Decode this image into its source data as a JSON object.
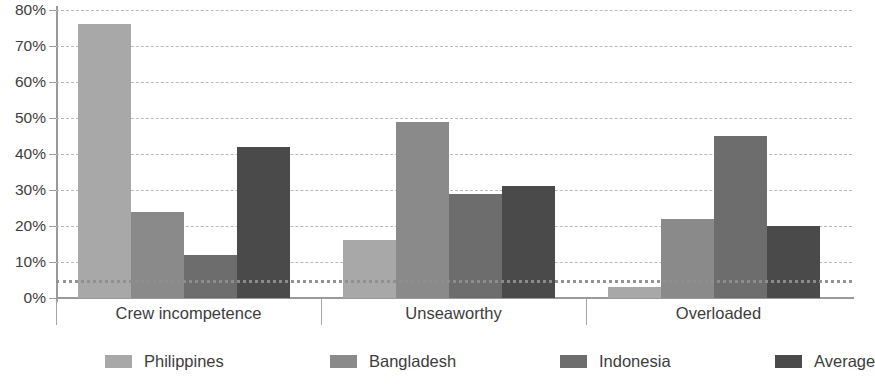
{
  "chart_data": {
    "type": "bar",
    "title": "",
    "xlabel": "",
    "ylabel": "",
    "ylim": [
      0,
      80
    ],
    "y_tick_step": 10,
    "y_tick_labels": [
      "0%",
      "10%",
      "20%",
      "30%",
      "40%",
      "50%",
      "60%",
      "70%",
      "80%"
    ],
    "grid": true,
    "legend_position": "bottom",
    "categories": [
      "Crew incompetence",
      "Unseaworthy",
      "Overloaded"
    ],
    "series": [
      {
        "name": "Philippines",
        "color": "#a8a8a8",
        "values": [
          76,
          16,
          3
        ]
      },
      {
        "name": "Bangladesh",
        "color": "#8a8a8a",
        "values": [
          24,
          49,
          22
        ]
      },
      {
        "name": "Indonesia",
        "color": "#6d6d6d",
        "values": [
          12,
          29,
          45
        ]
      },
      {
        "name": "Average",
        "color": "#4a4a4a",
        "values": [
          42,
          31,
          20
        ]
      }
    ],
    "reference_line": {
      "value": 5,
      "style": "dotted",
      "color": "#8f8f8f"
    }
  },
  "axis": {
    "y_ticks": [
      {
        "label": "80%",
        "value": 80
      },
      {
        "label": "70%",
        "value": 70
      },
      {
        "label": "60%",
        "value": 60
      },
      {
        "label": "50%",
        "value": 50
      },
      {
        "label": "40%",
        "value": 40
      },
      {
        "label": "30%",
        "value": 30
      },
      {
        "label": "20%",
        "value": 20
      },
      {
        "label": "10%",
        "value": 10
      },
      {
        "label": "0%",
        "value": 0
      }
    ]
  },
  "categories": [
    {
      "label": "Crew incompetence"
    },
    {
      "label": "Unseaworthy"
    },
    {
      "label": "Overloaded"
    }
  ],
  "legend": [
    {
      "label": "Philippines",
      "color": "#a8a8a8"
    },
    {
      "label": "Bangladesh",
      "color": "#8a8a8a"
    },
    {
      "label": "Indonesia",
      "color": "#6d6d6d"
    },
    {
      "label": "Average",
      "color": "#4a4a4a"
    }
  ]
}
